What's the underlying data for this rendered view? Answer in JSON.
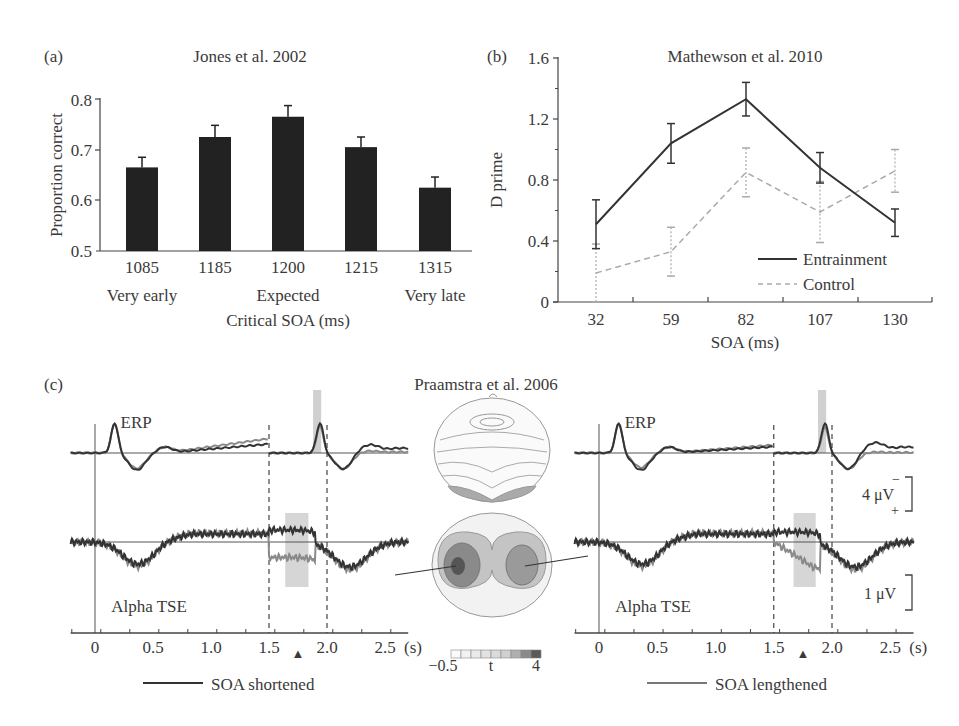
{
  "figure": {
    "panels": [
      "(a)",
      "(b)",
      "(c)"
    ]
  },
  "chart_data": [
    {
      "id": "a",
      "panel_label": "(a)",
      "type": "bar",
      "title": "Jones et al. 2002",
      "xlabel": "Critical SOA (ms)",
      "ylabel": "Proportion correct",
      "ylim": [
        0.5,
        0.8
      ],
      "yticks": [
        "0.5",
        "0.6",
        "0.7",
        "0.8"
      ],
      "categories": [
        "1085",
        "1185",
        "1200",
        "1215",
        "1315"
      ],
      "sublabels": [
        "Very early",
        "",
        "Expected",
        "",
        "Very late"
      ],
      "values": [
        0.665,
        0.725,
        0.765,
        0.705,
        0.625
      ],
      "errors": [
        0.02,
        0.023,
        0.022,
        0.02,
        0.021
      ],
      "grid": false,
      "bar_color": "#222222"
    },
    {
      "id": "b",
      "panel_label": "(b)",
      "type": "line",
      "title": "Mathewson et al. 2010",
      "xlabel": "SOA (ms)",
      "ylabel": "D prime",
      "ylim": [
        0,
        1.6
      ],
      "yticks": [
        "0",
        "0.4",
        "0.8",
        "1.2",
        "1.6"
      ],
      "categories": [
        "32",
        "59",
        "82",
        "107",
        "130"
      ],
      "series": [
        {
          "name": "Entrainment",
          "style": "solid",
          "color": "#333333",
          "values": [
            0.51,
            1.04,
            1.33,
            0.88,
            0.52
          ],
          "errors": [
            0.16,
            0.13,
            0.11,
            0.1,
            0.09
          ]
        },
        {
          "name": "Control",
          "style": "dashed",
          "color": "#aaaaaa",
          "values": [
            0.19,
            0.33,
            0.85,
            0.59,
            0.86
          ],
          "errors": [
            0.19,
            0.16,
            0.16,
            0.2,
            0.14
          ]
        }
      ],
      "legend": {
        "position": "lower right",
        "entries": [
          "Entrainment",
          "Control"
        ]
      },
      "grid": false
    },
    {
      "id": "c",
      "panel_label": "(c)",
      "type": "line",
      "title": "Praamstra et al. 2006",
      "xlabel": "(s)",
      "xticks": [
        "0",
        "0.5",
        "1.0",
        "1.5",
        "2.0",
        "2.5"
      ],
      "xlim": [
        -0.2,
        2.7
      ],
      "trace_labels": [
        "ERP",
        "Alpha TSE"
      ],
      "event_marker": {
        "symbol": "▲",
        "x": 1.75
      },
      "dashed_markers_s": [
        1.5,
        2.0
      ],
      "shaded_windows_s": {
        "erp": [
          1.9,
          1.95
        ],
        "tse": [
          1.65,
          1.85
        ]
      },
      "subplots": [
        {
          "condition": "SOA shortened",
          "legend_label": "SOA shortened",
          "line_color": "#333333"
        },
        {
          "condition": "SOA lengthened",
          "legend_label": "SOA lengthened",
          "line_color": "#777777"
        }
      ],
      "scale_bars": {
        "erp": "4 μV",
        "erp_minus": "−",
        "erp_plus": "+",
        "tse": "1 μV"
      },
      "topo_colorbar": {
        "label": "t",
        "min": "−0.5",
        "max": "4"
      }
    }
  ]
}
